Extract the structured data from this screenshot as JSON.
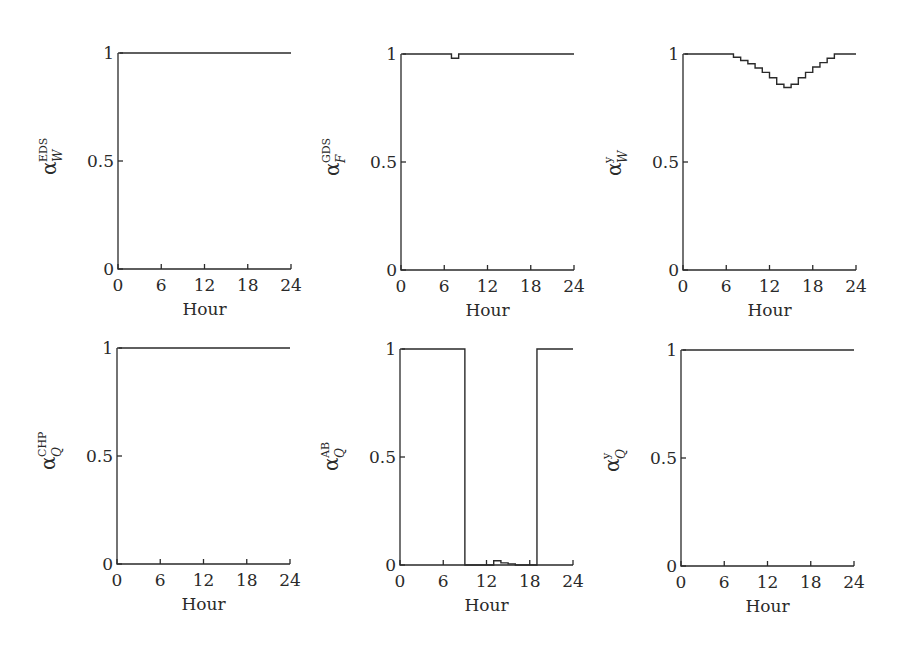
{
  "chart_data": [
    {
      "type": "line",
      "step": true,
      "title": "",
      "xlabel": "Hour",
      "ylabel": {
        "base": "α",
        "sup": "EDS",
        "sub": "W"
      },
      "xlim": [
        0,
        24
      ],
      "ylim": [
        0,
        1
      ],
      "xticks": [
        0,
        6,
        12,
        18,
        24
      ],
      "yticks": [
        0,
        0.5,
        1
      ],
      "ytick_labels": [
        "0",
        "0.5",
        "1"
      ],
      "x": [
        1,
        2,
        3,
        4,
        5,
        6,
        7,
        8,
        9,
        10,
        11,
        12,
        13,
        14,
        15,
        16,
        17,
        18,
        19,
        20,
        21,
        22,
        23,
        24
      ],
      "values": [
        1,
        1,
        1,
        1,
        1,
        1,
        1,
        1,
        1,
        1,
        1,
        1,
        1,
        1,
        1,
        1,
        1,
        1,
        1,
        1,
        1,
        1,
        1,
        1
      ]
    },
    {
      "type": "line",
      "step": true,
      "title": "",
      "xlabel": "Hour",
      "ylabel": {
        "base": "α",
        "sup": "GDS",
        "sub": "F"
      },
      "xlim": [
        0,
        24
      ],
      "ylim": [
        0,
        1
      ],
      "xticks": [
        0,
        6,
        12,
        18,
        24
      ],
      "yticks": [
        0,
        0.5,
        1
      ],
      "ytick_labels": [
        "0",
        "0.5",
        "1"
      ],
      "x": [
        1,
        2,
        3,
        4,
        5,
        6,
        7,
        8,
        9,
        10,
        11,
        12,
        13,
        14,
        15,
        16,
        17,
        18,
        19,
        20,
        21,
        22,
        23,
        24
      ],
      "values": [
        1,
        1,
        1,
        1,
        1,
        1,
        1,
        0.98,
        1,
        1,
        1,
        1,
        1,
        1,
        1,
        1,
        1,
        1,
        1,
        1,
        1,
        1,
        1,
        1
      ]
    },
    {
      "type": "line",
      "step": true,
      "title": "",
      "xlabel": "Hour",
      "ylabel": {
        "base": "α",
        "sup": "y",
        "sub": "W"
      },
      "xlim": [
        0,
        24
      ],
      "ylim": [
        0,
        1
      ],
      "xticks": [
        0,
        6,
        12,
        18,
        24
      ],
      "yticks": [
        0,
        0.5,
        1
      ],
      "ytick_labels": [
        "0",
        "0.5",
        "1"
      ],
      "x": [
        1,
        2,
        3,
        4,
        5,
        6,
        7,
        8,
        9,
        10,
        11,
        12,
        13,
        14,
        15,
        16,
        17,
        18,
        19,
        20,
        21,
        22,
        23,
        24
      ],
      "values": [
        1,
        1,
        1,
        1,
        1,
        1,
        1,
        0.985,
        0.97,
        0.955,
        0.935,
        0.915,
        0.89,
        0.86,
        0.845,
        0.86,
        0.89,
        0.915,
        0.94,
        0.96,
        0.98,
        1,
        1,
        1
      ]
    },
    {
      "type": "line",
      "step": true,
      "title": "",
      "xlabel": "Hour",
      "ylabel": {
        "base": "α",
        "sup": "CHP",
        "sub": "Q"
      },
      "xlim": [
        0,
        24
      ],
      "ylim": [
        0,
        1
      ],
      "xticks": [
        0,
        6,
        12,
        18,
        24
      ],
      "yticks": [
        0,
        0.5,
        1
      ],
      "ytick_labels": [
        "0",
        "0.5",
        "1"
      ],
      "x": [
        1,
        2,
        3,
        4,
        5,
        6,
        7,
        8,
        9,
        10,
        11,
        12,
        13,
        14,
        15,
        16,
        17,
        18,
        19,
        20,
        21,
        22,
        23,
        24
      ],
      "values": [
        1,
        1,
        1,
        1,
        1,
        1,
        1,
        1,
        1,
        1,
        1,
        1,
        1,
        1,
        1,
        1,
        1,
        1,
        1,
        1,
        1,
        1,
        1,
        1
      ]
    },
    {
      "type": "line",
      "step": true,
      "title": "",
      "xlabel": "Hour",
      "ylabel": {
        "base": "α",
        "sup": "AB",
        "sub": "Q"
      },
      "xlim": [
        0,
        24
      ],
      "ylim": [
        0,
        1
      ],
      "xticks": [
        0,
        6,
        12,
        18,
        24
      ],
      "yticks": [
        0,
        0.5,
        1
      ],
      "ytick_labels": [
        "0",
        "0.5",
        "1"
      ],
      "x": [
        1,
        2,
        3,
        4,
        5,
        6,
        7,
        8,
        9,
        10,
        11,
        12,
        13,
        14,
        15,
        16,
        17,
        18,
        19,
        20,
        21,
        22,
        23,
        24
      ],
      "values": [
        1,
        1,
        1,
        1,
        1,
        1,
        1,
        1,
        1,
        0,
        0,
        0,
        0,
        0.02,
        0.01,
        0.005,
        0,
        0,
        0,
        1,
        1,
        1,
        1,
        1
      ]
    },
    {
      "type": "line",
      "step": true,
      "title": "",
      "xlabel": "Hour",
      "ylabel": {
        "base": "α",
        "sup": "y",
        "sub": "Q"
      },
      "xlim": [
        0,
        24
      ],
      "ylim": [
        0,
        1
      ],
      "xticks": [
        0,
        6,
        12,
        18,
        24
      ],
      "yticks": [
        0,
        0.5,
        1
      ],
      "ytick_labels": [
        "0",
        "0.5",
        "1"
      ],
      "x": [
        1,
        2,
        3,
        4,
        5,
        6,
        7,
        8,
        9,
        10,
        11,
        12,
        13,
        14,
        15,
        16,
        17,
        18,
        19,
        20,
        21,
        22,
        23,
        24
      ],
      "values": [
        1,
        1,
        1,
        1,
        1,
        1,
        1,
        1,
        1,
        1,
        1,
        1,
        1,
        1,
        1,
        1,
        1,
        1,
        1,
        1,
        1,
        1,
        1,
        1
      ]
    }
  ],
  "panels": [
    {
      "id": "eds-w",
      "x0": 118,
      "x1": 291,
      "y0": 269,
      "y1": 53
    },
    {
      "id": "gds-f",
      "x0": 401,
      "x1": 574,
      "y0": 270,
      "y1": 54
    },
    {
      "id": "y-w",
      "x0": 683,
      "x1": 856,
      "y0": 270,
      "y1": 54
    },
    {
      "id": "chp-q",
      "x0": 117,
      "x1": 290,
      "y0": 564,
      "y1": 348
    },
    {
      "id": "ab-q",
      "x0": 400,
      "x1": 573,
      "y0": 565,
      "y1": 349
    },
    {
      "id": "y-q",
      "x0": 681,
      "x1": 854,
      "y0": 566,
      "y1": 350
    }
  ]
}
